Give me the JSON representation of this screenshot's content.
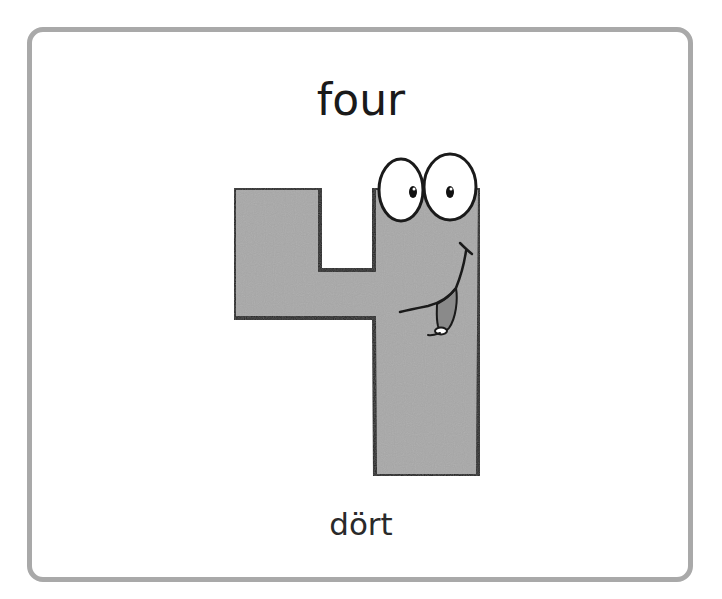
{
  "card": {
    "title": "four",
    "subtitle": "dört",
    "illustration": {
      "subject": "cartoon-number-four",
      "fill_color": "#a8a8a8",
      "outline_color": "#1a1a1a",
      "tongue_color": "#8a8a8a"
    }
  },
  "colors": {
    "background": "#ffffff",
    "card_border": "#a9a9a9",
    "text": "#1a1a1a"
  }
}
